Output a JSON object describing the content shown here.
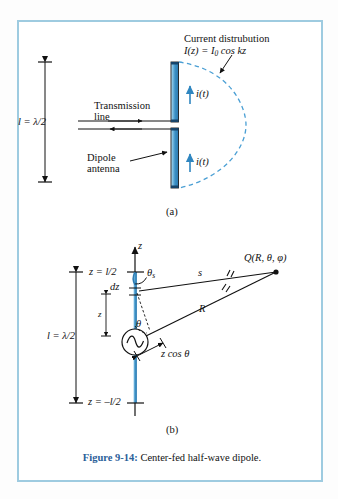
{
  "figure": {
    "caption_number": "Figure 9-14:",
    "caption_text": "Center-fed half-wave dipole.",
    "border_color": "#9ecbe0",
    "accent_blue": "#3a8fc4",
    "dashed_arc_color": "#4a9fd4",
    "caption_number_color": "#2a6099"
  },
  "panel_a": {
    "letter": "(a)",
    "length_label": "l = λ/2",
    "transmission_line_label_1": "Transmission",
    "transmission_line_label_2": "line",
    "dipole_label_1": "Dipole",
    "dipole_label_2": "antenna",
    "current_title": "Current distrubution",
    "current_equation_prefix": "I(z) = I",
    "current_equation_sub": "0",
    "current_equation_suffix": " cos kz",
    "current_arrow_upper": "i(t)",
    "current_arrow_lower": "i(t)"
  },
  "panel_b": {
    "letter": "(b)",
    "axis_label": "z",
    "length_label": "l = λ/2",
    "top_coord": "z = l/2",
    "bottom_coord": "z = –l/2",
    "element_label": "dz",
    "height_label": "z",
    "theta_s_base": "θ",
    "theta_s_sub": "s",
    "theta_label": "θ",
    "segment_s": "s",
    "segment_R": "R",
    "projection_label": "z cos θ",
    "point_label": "Q(R, θ, φ)"
  }
}
